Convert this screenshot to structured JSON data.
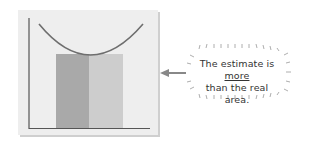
{
  "figure": {
    "title": "",
    "colors": {
      "background": "#eeeeee",
      "dark_bar": "#a9a9a9",
      "light_bar": "#cdcdcd",
      "curve": "#6e6e6e",
      "axis": "#555555",
      "arrow": "#888888"
    }
  },
  "callout": {
    "line1_prefix": "The estimate is ",
    "line1_emphasis": "more",
    "line2": "than the real area."
  }
}
